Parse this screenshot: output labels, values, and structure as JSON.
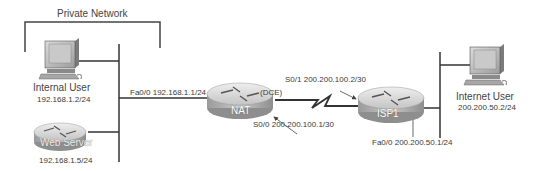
{
  "diagram": {
    "private_network_label": "Private Network",
    "devices": {
      "internal_user": {
        "name": "Internal User",
        "ip": "192.168.1.2/24"
      },
      "web_server": {
        "name": "Web Server",
        "ip": "192.168.1.5/24"
      },
      "nat_router": {
        "name": "NAT"
      },
      "isp_router": {
        "name": "ISP1"
      },
      "internet_user": {
        "name": "Internet User",
        "ip": "200.200.50.2/24"
      }
    },
    "interfaces": {
      "nat_fa0_0": "Fa0/0 192.168.1.1/24",
      "nat_dce": "(DCE)",
      "nat_s0_0": "S0/0 200.200.100.1/30",
      "isp_s0_1": "S0/1 200.200.100.2/30",
      "isp_fa0_0": "Fa0/0 200.200.50.1/24"
    },
    "colors": {
      "line": "#333333",
      "router_top": "#d8d8d8",
      "router_side": "#a9a9a9"
    }
  }
}
